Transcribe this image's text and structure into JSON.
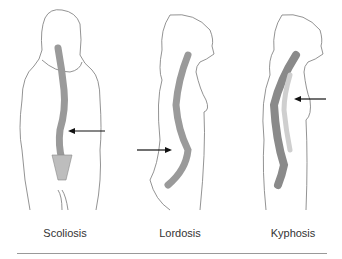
{
  "figures": [
    {
      "label": "Scoliosis",
      "arrow_direction": "left"
    },
    {
      "label": "Lordosis",
      "arrow_direction": "right"
    },
    {
      "label": "Kyphosis",
      "arrow_direction": "left"
    }
  ],
  "colors": {
    "outline": "#777777",
    "spine": "#9a9a9a",
    "spine_light": "#cfcfcf",
    "arrow": "#111111",
    "rule": "#999999",
    "text": "#333333"
  }
}
